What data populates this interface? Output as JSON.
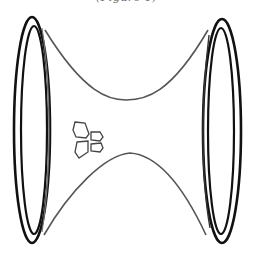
{
  "figure": {
    "caption": "(Figure 1)"
  },
  "colors": {
    "rim_stroke": "#111111",
    "body_stroke": "#555555",
    "keypad_stroke": "#444444",
    "background": "#ffffff"
  },
  "icons": {
    "left_end": "ellipse-rim",
    "right_end": "ellipse-rim",
    "keypad": "four-button-pad-icon"
  }
}
